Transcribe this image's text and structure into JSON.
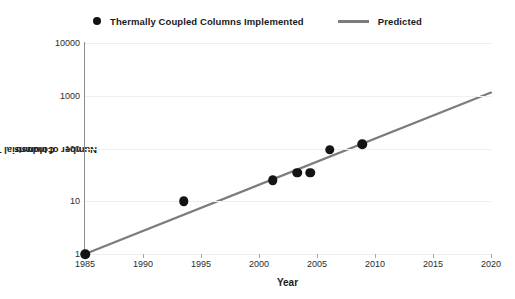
{
  "legend": {
    "entries": [
      {
        "label": "Thermally Coupled Columns Implemented",
        "marker": "circle-marker-icon",
        "color": "#141414"
      },
      {
        "label": "Predicted",
        "marker": "line-marker-icon",
        "color": "#7c7c7c"
      }
    ]
  },
  "axes": {
    "y_title": "Number of  Industrial Thermally Coupled",
    "y_title_line2": "Columns",
    "x_title": "Year",
    "y_ticks": [
      "10000",
      "1000",
      "100",
      "10",
      "1"
    ],
    "x_ticks": [
      "1985",
      "1990",
      "1995",
      "2000",
      "2005",
      "2010",
      "2015",
      "2020"
    ]
  },
  "chart_data": {
    "type": "scatter",
    "title": "",
    "subtitle": "",
    "xlabel": "Year",
    "ylabel": "Number of Industrial Thermally Coupled Columns",
    "xlim": [
      1985,
      2020
    ],
    "ylim": [
      1,
      10000
    ],
    "yscale": "log",
    "xscale": "linear",
    "grid": true,
    "gridlines_y": [
      1,
      10,
      100,
      1000,
      10000
    ],
    "legend_position": "top-center",
    "series": [
      {
        "name": "Thermally Coupled Columns Implemented",
        "type": "scatter",
        "color": "#141414",
        "marker": "circle",
        "x": [
          1985,
          1993.5,
          2001.2,
          2003.3,
          2004.4,
          2006.1,
          2008.9
        ],
        "y": [
          1,
          10,
          25,
          35,
          35,
          95,
          120
        ]
      },
      {
        "name": "Predicted",
        "type": "line",
        "color": "#7c7c7c",
        "x": [
          1985,
          2020
        ],
        "y": [
          1,
          1150
        ]
      }
    ]
  }
}
